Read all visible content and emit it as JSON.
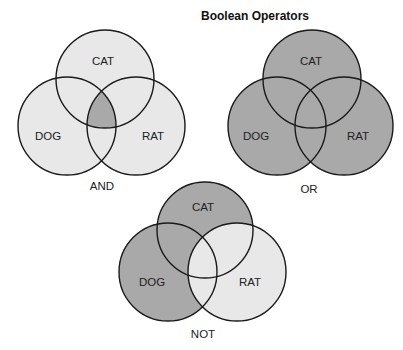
{
  "title": "Boolean Operators",
  "colors": {
    "light": "#e8e8e8",
    "dark": "#a9a9a9",
    "stroke": "#1a1a1a"
  },
  "diagrams": [
    {
      "operator": "AND",
      "sets": [
        "CAT",
        "DOG",
        "RAT"
      ],
      "highlight": "intersection of CAT, DOG and RAT"
    },
    {
      "operator": "OR",
      "sets": [
        "CAT",
        "DOG",
        "RAT"
      ],
      "highlight": "union of CAT, DOG and RAT"
    },
    {
      "operator": "NOT",
      "sets": [
        "CAT",
        "DOG",
        "RAT"
      ],
      "highlight": "CAT and DOG excluding RAT"
    }
  ]
}
